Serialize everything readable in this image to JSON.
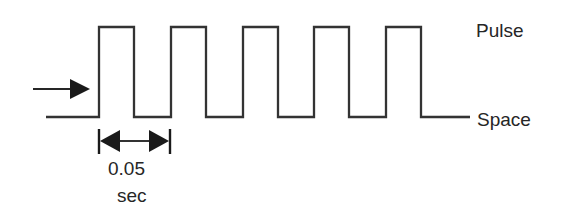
{
  "figure": {
    "background_color": "#ffffff",
    "line_color": "#333333",
    "text_color": "#262626"
  },
  "labels": {
    "pulse": "Pulse",
    "space": "Space",
    "dimension_value": "0.05",
    "dimension_unit": "sec"
  },
  "chart_data": {
    "type": "line",
    "title": "",
    "xlabel": "",
    "ylabel": "",
    "levels": {
      "pulse_label": "Pulse",
      "space_label": "Space",
      "pulse_y_px": 27,
      "space_y_px": 117
    },
    "period_seconds": 0.05,
    "duty_cycle": 0.5,
    "pulse_count": 5,
    "waveform_points_px": [
      [
        46,
        117
      ],
      [
        99,
        117
      ],
      [
        99,
        27
      ],
      [
        134,
        27
      ],
      [
        134,
        117
      ],
      [
        171,
        117
      ],
      [
        171,
        27
      ],
      [
        206,
        27
      ],
      [
        206,
        117
      ],
      [
        243,
        117
      ],
      [
        243,
        27
      ],
      [
        278,
        27
      ],
      [
        278,
        117
      ],
      [
        314,
        117
      ],
      [
        314,
        27
      ],
      [
        349,
        27
      ],
      [
        349,
        117
      ],
      [
        386,
        117
      ],
      [
        386,
        27
      ],
      [
        421,
        27
      ],
      [
        421,
        117
      ],
      [
        470,
        117
      ]
    ],
    "annotations": [
      {
        "name": "input-arrow",
        "kind": "arrow",
        "from_px": [
          33,
          89
        ],
        "to_px": [
          88,
          89
        ]
      },
      {
        "name": "period-dimension",
        "kind": "dimension",
        "text": "0.05 sec",
        "left_tick_px": 99,
        "right_tick_px": 170,
        "line_y_px": 141,
        "tick_top_px": 129,
        "tick_bottom_px": 154
      }
    ]
  }
}
